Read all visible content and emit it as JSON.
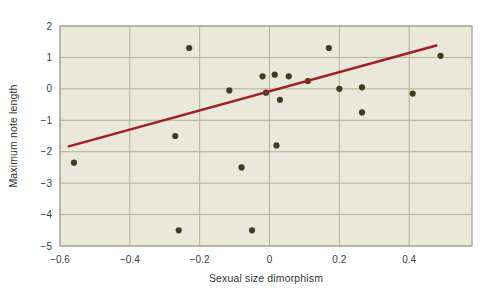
{
  "chart_data": {
    "type": "scatter",
    "title": "",
    "xlabel": "Sexual size dimorphism",
    "ylabel": "Maximum note length",
    "xlim": [
      -0.6,
      0.58
    ],
    "ylim": [
      -5,
      2
    ],
    "x_ticks": [
      -0.6,
      -0.4,
      -0.2,
      0,
      0.2,
      0.4
    ],
    "x_tick_labels": [
      "−0.6",
      "−0.4",
      "−0.2",
      "0",
      "0.2",
      "0.4"
    ],
    "y_ticks": [
      2,
      1,
      0,
      -1,
      -2,
      -3,
      -4,
      -5
    ],
    "y_tick_labels": [
      "2",
      "1",
      "0",
      "−1",
      "−2",
      "−3",
      "−4",
      "−5"
    ],
    "grid": true,
    "legend": "none",
    "points": [
      [
        -0.56,
        -2.35
      ],
      [
        -0.27,
        -1.5
      ],
      [
        -0.26,
        -4.5
      ],
      [
        -0.23,
        1.3
      ],
      [
        -0.115,
        -0.05
      ],
      [
        -0.08,
        -2.5
      ],
      [
        -0.05,
        -4.5
      ],
      [
        -0.02,
        0.4
      ],
      [
        -0.01,
        -0.12
      ],
      [
        0.015,
        0.45
      ],
      [
        0.02,
        -1.8
      ],
      [
        0.03,
        -0.35
      ],
      [
        0.055,
        0.4
      ],
      [
        0.11,
        0.25
      ],
      [
        0.17,
        1.3
      ],
      [
        0.2,
        0.0
      ],
      [
        0.265,
        0.05
      ],
      [
        0.265,
        -0.75
      ],
      [
        0.41,
        -0.15
      ],
      [
        0.49,
        1.05
      ]
    ],
    "trend_line": {
      "x1": -0.575,
      "y1": -1.83,
      "x2": 0.478,
      "y2": 1.38
    },
    "colors": {
      "plot_background": "#e9e8db",
      "grid": "#b2b199",
      "border": "#a3a289",
      "point": "#3d401f",
      "trend": "#9f1f24",
      "tick_text": "#3c3c3c",
      "label_text": "#343434"
    }
  }
}
